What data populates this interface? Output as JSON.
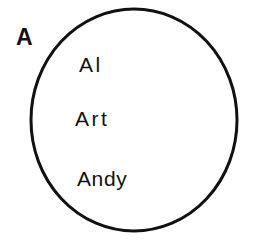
{
  "diagram": {
    "type": "venn-single-set",
    "background_color": "#ffffff",
    "stroke_color": "#111111",
    "text_color": "#111111",
    "set": {
      "label": "A",
      "shape": "circle",
      "center_x": 134,
      "center_y": 120,
      "radius_x": 103,
      "radius_y": 111,
      "stroke_width": 3,
      "fill": "none"
    },
    "members": [
      {
        "label": "Al"
      },
      {
        "label": "Art"
      },
      {
        "label": "Andy"
      }
    ]
  }
}
